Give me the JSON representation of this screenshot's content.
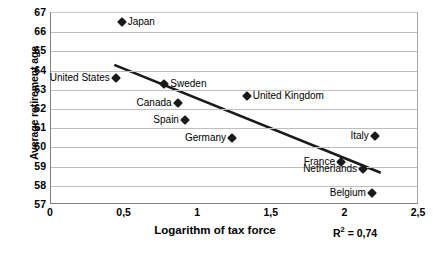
{
  "chart_data": {
    "type": "scatter",
    "title": "",
    "xlabel": "Logarithm of tax force",
    "ylabel": "Average retirement age",
    "xlim": [
      0,
      2.5
    ],
    "ylim": [
      57,
      67
    ],
    "grid": true,
    "legend": "none",
    "x_ticks": [
      "0",
      "0,5",
      "1",
      "1,5",
      "2",
      "2,5"
    ],
    "x_tick_values": [
      0,
      0.5,
      1,
      1.5,
      2,
      2.5
    ],
    "y_ticks": [
      "57",
      "58",
      "59",
      "60",
      "61",
      "62",
      "63",
      "64",
      "65",
      "66",
      "67"
    ],
    "y_tick_values": [
      57,
      58,
      59,
      60,
      61,
      62,
      63,
      64,
      65,
      66,
      67
    ],
    "points": [
      {
        "label": "Japan",
        "x": 0.48,
        "y": 66.55,
        "label_side": "right"
      },
      {
        "label": "United States",
        "x": 0.44,
        "y": 63.6,
        "label_side": "left"
      },
      {
        "label": "Sweden",
        "x": 0.77,
        "y": 63.3,
        "label_side": "right"
      },
      {
        "label": "Canada",
        "x": 0.86,
        "y": 62.3,
        "label_side": "left"
      },
      {
        "label": "United Kingdom",
        "x": 1.33,
        "y": 62.7,
        "label_side": "right"
      },
      {
        "label": "Spain",
        "x": 0.91,
        "y": 61.45,
        "label_side": "left"
      },
      {
        "label": "Germany",
        "x": 1.23,
        "y": 60.5,
        "label_side": "left"
      },
      {
        "label": "Italy",
        "x": 2.2,
        "y": 60.6,
        "label_side": "left"
      },
      {
        "label": "France",
        "x": 1.97,
        "y": 59.25,
        "label_side": "left"
      },
      {
        "label": "Netherlands",
        "x": 2.12,
        "y": 58.85,
        "label_side": "left"
      },
      {
        "label": "Belgium",
        "x": 2.18,
        "y": 57.6,
        "label_side": "left"
      }
    ],
    "trendline": {
      "x_start": 0.43,
      "y_start": 64.3,
      "x_end": 2.24,
      "y_end": 58.68
    },
    "annotations": [
      {
        "name": "r-squared",
        "text_prefix": "R",
        "text_sup": "2",
        "text_suffix": " = 0,74"
      }
    ]
  }
}
